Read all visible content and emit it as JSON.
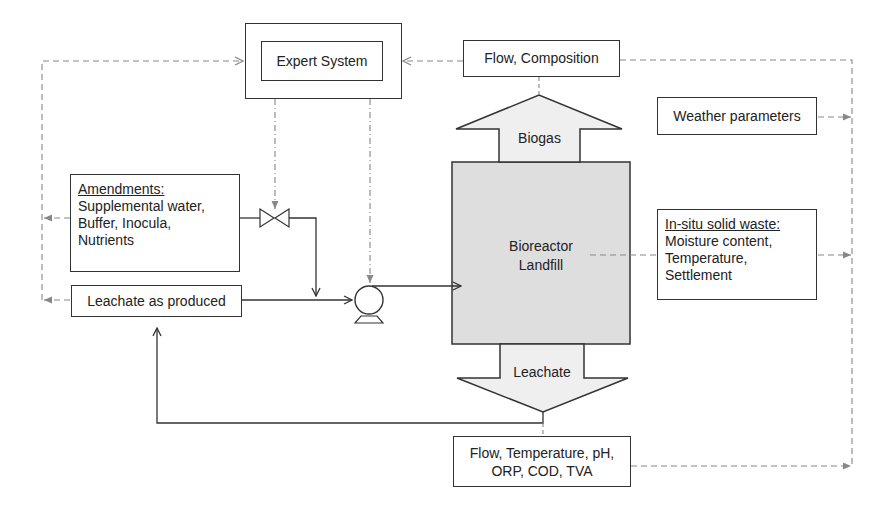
{
  "diagram": {
    "expert_system": "Expert System",
    "flow_composition": "Flow, Composition",
    "weather_parameters": "Weather parameters",
    "biogas": "Biogas",
    "bioreactor_line1": "Bioreactor",
    "bioreactor_line2": "Landfill",
    "leachate": "Leachate",
    "amendments": {
      "title": "Amendments:",
      "lines": [
        "Supplemental water,",
        "Buffer, Inocula,",
        "Nutrients"
      ]
    },
    "leachate_as_produced": "Leachate as produced",
    "in_situ": {
      "title": "In-situ solid waste:",
      "lines": [
        "Moisture content,",
        "Temperature,",
        "Settlement"
      ]
    },
    "leachate_params": {
      "lines": [
        "Flow, Temperature, pH,",
        "ORP, COD, TVA"
      ]
    },
    "colors": {
      "line": "#333333",
      "dashed": "#888888",
      "reactor_fill": "#dedede"
    }
  }
}
